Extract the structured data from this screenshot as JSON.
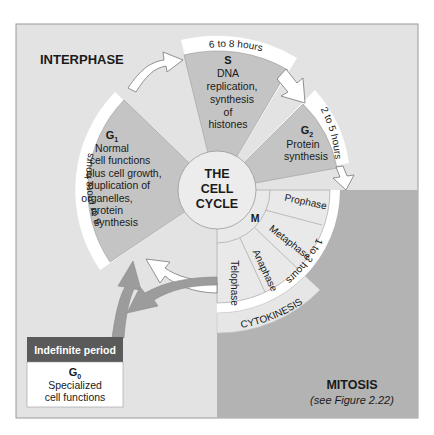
{
  "diagram": {
    "title_center": [
      "THE",
      "CELL",
      "CYCLE"
    ],
    "interphase_label": "INTERPHASE",
    "mitosis": {
      "label": "MITOSIS",
      "subtitle": "(see Figure 2.22)"
    },
    "phases": {
      "g1": {
        "name": "G",
        "sub": "1",
        "lines": [
          "Normal",
          "cell functions",
          "plus cell growth,",
          "duplication of",
          "organelles,",
          "protein",
          "synthesis"
        ],
        "duration": "8 or more hours"
      },
      "s": {
        "name": "S",
        "lines": [
          "DNA",
          "replication,",
          "synthesis",
          "of",
          "histones"
        ],
        "duration": "6 to 8 hours"
      },
      "g2": {
        "name": "G",
        "sub": "2",
        "lines": [
          "Protein",
          "synthesis"
        ],
        "duration": "2 to 5 hours"
      },
      "m": {
        "name": "M",
        "stages": [
          "Prophase",
          "Metaphase",
          "Anaphase",
          "Telophase"
        ],
        "duration": "1 to 3 hours",
        "cytokinesis": "CYTOKINESIS"
      },
      "g0": {
        "header": "Indefinite period",
        "name": "G",
        "sub": "0",
        "lines": [
          "Specialized",
          "cell functions"
        ]
      }
    },
    "colors": {
      "background": "#e3e3e3",
      "mitosis_bg": "#b3b3b3",
      "phase_fill": "#c4c4c4",
      "m_fill": "#e9e9e9",
      "center_fill": "#ececec",
      "g0_header": "#5a5a5a",
      "g0_arrows": "#9c9c9c"
    }
  }
}
